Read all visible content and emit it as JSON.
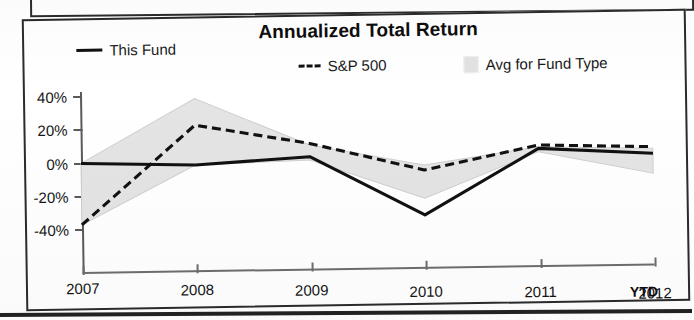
{
  "document": {
    "kind": "scanned-fund-factsheet-chart",
    "top_strip_present": true,
    "bottom_rule_present": true
  },
  "chart_data": {
    "type": "line",
    "title": "Annualized Total Return",
    "xlabel": "",
    "ylabel": "",
    "x": [
      "2007",
      "2008",
      "2009",
      "2010",
      "2011",
      "2012"
    ],
    "categories": [
      "2007",
      "2008",
      "2009",
      "2010",
      "2011",
      "2012"
    ],
    "x_tick_labels": [
      "2007",
      "2008",
      "2009",
      "2010",
      "2011",
      "2012"
    ],
    "x_axis_suffix": "YTD",
    "y_tick_labels": [
      "40%",
      "20%",
      "0%",
      "-20%",
      "-40%"
    ],
    "y_tick_values": [
      40,
      20,
      0,
      -20,
      -40
    ],
    "ylim": [
      -48,
      44
    ],
    "grid": false,
    "legend_position": "top",
    "series": [
      {
        "name": "This Fund",
        "style": "solid",
        "color": "#111111",
        "values": [
          0,
          -2,
          2,
          -34,
          5,
          1
        ]
      },
      {
        "name": "S&P 500",
        "style": "dashed",
        "color": "#111111",
        "values": [
          -37,
          22,
          10,
          -7,
          7,
          5
        ]
      },
      {
        "name": "Avg for Fund Type",
        "style": "band",
        "color": "#e4e4e4",
        "band_upper": [
          0,
          38,
          9,
          -4,
          6,
          4
        ],
        "band_lower": [
          -37,
          -2,
          0,
          -24,
          3,
          -11
        ]
      }
    ],
    "legend": [
      {
        "label": "This Fund",
        "marker": "solid-line"
      },
      {
        "label": "S&P 500",
        "marker": "dashed-line"
      },
      {
        "label": "Avg for Fund Type",
        "marker": "gray-swatch"
      }
    ]
  },
  "colors": {
    "ink": "#111111",
    "axis": "#5a5a5a",
    "band": "#e4e4e4",
    "frame": "#2b2b2b",
    "paper": "#ffffff"
  }
}
